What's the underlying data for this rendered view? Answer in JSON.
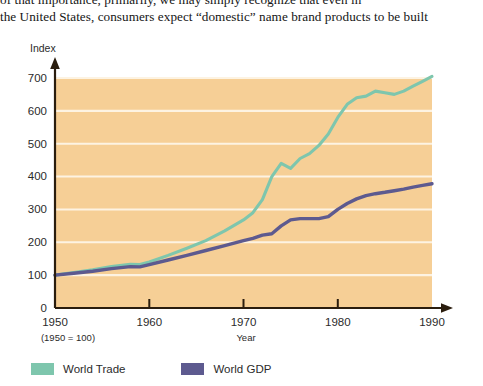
{
  "bodytext": {
    "line_clipped": "of that importance, primarily, we may simply recognize that even in",
    "line_visible": "the United States, consumers expect “domestic” name brand products to be built"
  },
  "figure": {
    "y_axis_title": "Index",
    "x_axis_title": "Year",
    "base_note": "(1950 = 100)",
    "plot_bg_color": "#f6cf96",
    "gridline_color": "#fdf3e2",
    "axis_color": "#2a1d0e"
  },
  "legend": {
    "position": "below-plot",
    "items": [
      {
        "label": "World Trade",
        "color": "#7ec6ad"
      },
      {
        "label": "World GDP",
        "color": "#5d5a8f"
      }
    ]
  },
  "chart_data": {
    "type": "line",
    "title": "",
    "xlabel": "Year",
    "ylabel": "Index",
    "note": "(1950 = 100)",
    "xlim": [
      1950,
      1990
    ],
    "ylim": [
      0,
      700
    ],
    "xticks": [
      1950,
      1960,
      1970,
      1980,
      1990
    ],
    "yticks": [
      0,
      100,
      200,
      300,
      400,
      500,
      600,
      700
    ],
    "grid": "horizontal",
    "legend_position": "bottom-left",
    "x": [
      1950,
      1952,
      1954,
      1956,
      1958,
      1959,
      1960,
      1962,
      1964,
      1966,
      1968,
      1970,
      1971,
      1972,
      1973,
      1974,
      1975,
      1976,
      1977,
      1978,
      1979,
      1980,
      1981,
      1982,
      1983,
      1984,
      1985,
      1986,
      1987,
      1988,
      1989,
      1990
    ],
    "series": [
      {
        "name": "World Trade",
        "color": "#7ec6ad",
        "values": [
          100,
          108,
          116,
          126,
          133,
          132,
          140,
          160,
          182,
          205,
          235,
          268,
          290,
          330,
          400,
          440,
          425,
          455,
          470,
          495,
          530,
          580,
          620,
          640,
          645,
          660,
          655,
          650,
          660,
          675,
          690,
          705
        ]
      },
      {
        "name": "World GDP",
        "color": "#5d5a8f",
        "values": [
          100,
          106,
          112,
          120,
          126,
          125,
          132,
          146,
          160,
          175,
          190,
          205,
          212,
          222,
          226,
          250,
          268,
          272,
          272,
          272,
          278,
          300,
          318,
          332,
          342,
          348,
          352,
          357,
          362,
          368,
          373,
          378
        ]
      }
    ]
  }
}
